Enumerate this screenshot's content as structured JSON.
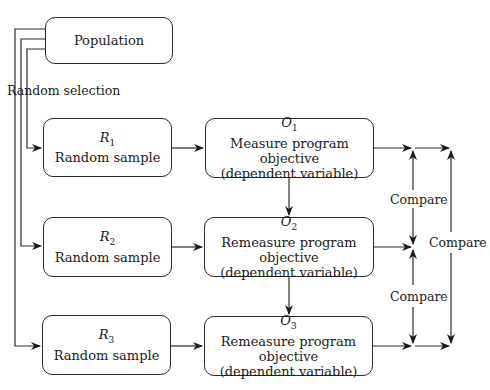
{
  "diagram": {
    "population": {
      "label": "Population"
    },
    "random_selection_label": "Random selection",
    "samples": [
      {
        "symbol": "R",
        "subscript": "1",
        "label": "Random sample"
      },
      {
        "symbol": "R",
        "subscript": "2",
        "label": "Random sample"
      },
      {
        "symbol": "R",
        "subscript": "3",
        "label": "Random sample"
      }
    ],
    "observations": [
      {
        "symbol": "O",
        "subscript": "1",
        "line1": "Measure program objective",
        "line2": "(dependent variable)"
      },
      {
        "symbol": "O",
        "subscript": "2",
        "line1": "Remeasure program objective",
        "line2": "(dependent variable)"
      },
      {
        "symbol": "O",
        "subscript": "3",
        "line1": "Remeasure program objective",
        "line2": "(dependent variable)"
      }
    ],
    "compare_labels": {
      "o1_o2": "Compare",
      "o2_o3": "Compare",
      "o1_o3": "Compare"
    }
  }
}
